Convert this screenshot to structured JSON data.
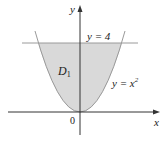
{
  "figure": {
    "axis_labels": {
      "x": "x",
      "y": "y"
    },
    "origin_label": "0",
    "region_label": "D",
    "region_subscript": "1",
    "line_label": "y = 4",
    "curve_label_base": "y = x",
    "curve_label_exp": "2",
    "colors": {
      "fill": "#d9d9d9",
      "axis": "#333333",
      "line": "#9a9a9a",
      "curve": "#9a9a9a",
      "text": "#222222"
    }
  }
}
